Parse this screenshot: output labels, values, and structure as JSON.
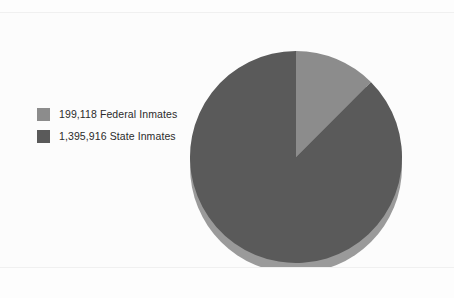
{
  "chart_data": {
    "type": "pie",
    "title": "",
    "subtitle": "",
    "xlabel": "",
    "ylabel": "",
    "grid": false,
    "legend_position": "left",
    "style": "3d",
    "start_angle_deg": 0,
    "direction": "clockwise",
    "total": 1595034,
    "categories": [
      "Federal Inmates",
      "State Inmates"
    ],
    "values": [
      199118,
      1395916
    ],
    "percentages": [
      12.5,
      87.5
    ],
    "value_labels": [
      "199,118",
      "1,395,916"
    ],
    "slices": [
      {
        "label": "199,118 Federal Inmates",
        "category": "Federal Inmates",
        "value": 199118,
        "value_label": "199,118",
        "percent": 12.5,
        "color": "#8c8c8c"
      },
      {
        "label": "1,395,916 State Inmates",
        "category": "State Inmates",
        "value": 1395916,
        "value_label": "1,395,916",
        "percent": 87.5,
        "color": "#5a5a5a"
      }
    ],
    "colors": {
      "federal": "#8c8c8c",
      "state": "#5a5a5a",
      "rim_federal": "#6f6f6f",
      "rim_state": "#9a9a9a",
      "background": "#fdfdfd",
      "rule": "#f0f0f0",
      "text": "#2b2b2b"
    }
  },
  "legend": {
    "items": [
      {
        "label": "199,118 Federal Inmates",
        "color": "#8c8c8c"
      },
      {
        "label": "1,395,916 State Inmates",
        "color": "#5a5a5a"
      }
    ]
  }
}
